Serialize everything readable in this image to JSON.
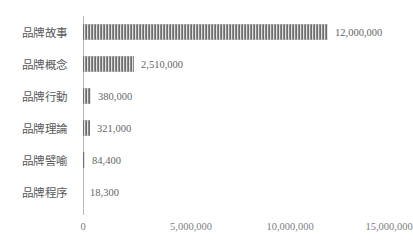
{
  "chart_data": {
    "type": "bar",
    "orientation": "horizontal",
    "title": "",
    "subtitle": "",
    "xlabel": "",
    "ylabel": "",
    "categories": [
      "品牌故事",
      "品牌概念",
      "品牌行動",
      "品牌理論",
      "品牌譬喻",
      "品牌程序"
    ],
    "values": [
      12000000,
      2510000,
      380000,
      321000,
      84400,
      18300
    ],
    "data_labels": [
      "12,000,000",
      "2,510,000",
      "380,000",
      "321,000",
      "84,400",
      "18,300"
    ],
    "xlim": [
      0,
      15000000
    ],
    "xticks": [
      0,
      5000000,
      10000000,
      15000000
    ],
    "xtick_labels": [
      "0",
      "5,000,000",
      "10,000,000",
      "15,000,000"
    ],
    "grid": false,
    "legend": false,
    "bar_color": "#808080",
    "bar_pattern": "vertical-stripes",
    "axis_color": "#b8b8b8",
    "label_color": "#595959",
    "value_color": "#666666",
    "background": "#ffffff"
  }
}
